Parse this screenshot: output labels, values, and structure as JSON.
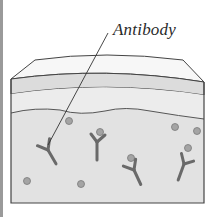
{
  "diagram": {
    "label": "Antibody",
    "colors": {
      "outline": "#444444",
      "top_layer": "#f6f6f6",
      "band_layer": "#dedede",
      "middle_layer": "#ebebeb",
      "lower_layer": "#e3e3e3",
      "antibody_fill": "#8c8c8c",
      "particle_fill": "#a4a4a4"
    },
    "layers": [
      "top surface",
      "band",
      "middle layer",
      "fluid layer with antibodies and particles"
    ],
    "antibodies": [
      {
        "x": 48,
        "y": 150,
        "rot": -30
      },
      {
        "x": 97,
        "y": 140,
        "rot": 0
      },
      {
        "x": 134,
        "y": 168,
        "rot": -25
      },
      {
        "x": 185,
        "y": 162,
        "rot": 20
      }
    ],
    "particles": [
      {
        "x": 69,
        "y": 121
      },
      {
        "x": 175,
        "y": 127
      },
      {
        "x": 197,
        "y": 131
      },
      {
        "x": 100,
        "y": 132
      },
      {
        "x": 131,
        "y": 158
      },
      {
        "x": 188,
        "y": 148
      },
      {
        "x": 27,
        "y": 181
      },
      {
        "x": 81,
        "y": 184
      }
    ]
  }
}
